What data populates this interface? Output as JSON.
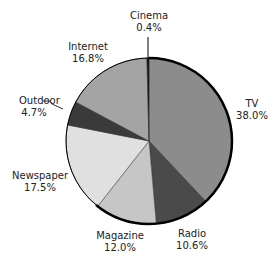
{
  "chart_data": {
    "type": "pie",
    "title": "",
    "start_angle_deg": 0,
    "direction": "clockwise",
    "unit": "%",
    "slices": [
      {
        "label": "TV",
        "value": 38.0,
        "display": "38.0%",
        "color": "#8c8c8c"
      },
      {
        "label": "Radio",
        "value": 10.6,
        "display": "10.6%",
        "color": "#4a4a4a"
      },
      {
        "label": "Magazine",
        "value": 12.0,
        "display": "12.0%",
        "color": "#c6c6c6"
      },
      {
        "label": "Newspaper",
        "value": 17.5,
        "display": "17.5%",
        "color": "#e0e0e0"
      },
      {
        "label": "Outdoor",
        "value": 4.7,
        "display": "4.7%",
        "color": "#3a3a3a"
      },
      {
        "label": "Internet",
        "value": 16.8,
        "display": "16.8%",
        "color": "#a4a4a4"
      },
      {
        "label": "Cinema",
        "value": 0.4,
        "display": "0.4%",
        "color": "#111111"
      }
    ],
    "categories": [
      "TV",
      "Radio",
      "Magazine",
      "Newspaper",
      "Outdoor",
      "Internet",
      "Cinema"
    ],
    "values": [
      38.0,
      10.6,
      12.0,
      17.5,
      4.7,
      16.8,
      0.4
    ]
  },
  "labels": [
    {
      "name": "Cinema",
      "pct": "0.4%"
    },
    {
      "name": "Internet",
      "pct": "16.8%"
    },
    {
      "name": "Outdoor",
      "pct": "4.7%"
    },
    {
      "name": "Newspaper",
      "pct": "17.5%"
    },
    {
      "name": "Magazine",
      "pct": "12.0%"
    },
    {
      "name": "Radio",
      "pct": "10.6%"
    },
    {
      "name": "TV",
      "pct": "38.0%"
    }
  ]
}
